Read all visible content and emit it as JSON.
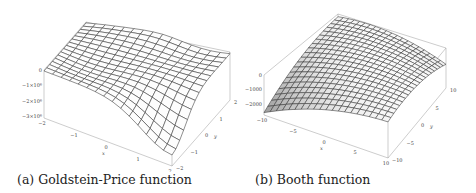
{
  "figures": [
    {
      "id": "a",
      "caption": "(a) Goldstein-Price function",
      "zaxis_ticks": [
        "0",
        "−1×10⁶",
        "−2×10⁶",
        "−3×10⁶"
      ],
      "xaxis_ticks": [
        "−2",
        "−1",
        "0",
        "1",
        "2"
      ],
      "yaxis_ticks": [
        "−2",
        "−1",
        "0",
        "1",
        "2"
      ],
      "xaxis_label": "x",
      "yaxis_label": "y"
    },
    {
      "id": "b",
      "caption": "(b) Booth function",
      "zaxis_ticks": [
        "0",
        "−1000",
        "−2000"
      ],
      "xaxis_ticks": [
        "−10",
        "−5",
        "0",
        "5",
        "10"
      ],
      "yaxis_ticks": [
        "−10",
        "−5",
        "0",
        "5",
        "10"
      ],
      "xaxis_label": "x",
      "yaxis_label": "y"
    }
  ],
  "chart_data": [
    {
      "type": "surface",
      "title": "(a) Goldstein-Price function",
      "xlabel": "x",
      "ylabel": "y",
      "zlabel": "",
      "xlim": [
        -2,
        2
      ],
      "ylim": [
        -2,
        2
      ],
      "zlim": [
        -3000000,
        0
      ],
      "xticks": [
        -2,
        -1,
        0,
        1,
        2
      ],
      "yticks": [
        -2,
        -1,
        0,
        1,
        2
      ],
      "zticks": [
        0,
        -1000000,
        -2000000,
        -3000000
      ],
      "grid": false,
      "mesh": "15x15 wireframe, negated Goldstein-Price surface"
    },
    {
      "type": "surface",
      "title": "(b) Booth function",
      "xlabel": "x",
      "ylabel": "y",
      "zlabel": "",
      "xlim": [
        -10,
        10
      ],
      "ylim": [
        -10,
        10
      ],
      "zlim": [
        -2500,
        0
      ],
      "xticks": [
        -10,
        -5,
        0,
        5,
        10
      ],
      "yticks": [
        -10,
        -5,
        0,
        5,
        10
      ],
      "zticks": [
        0,
        -1000,
        -2000
      ],
      "grid": false,
      "mesh": "20x20 wireframe, negated Booth surface"
    }
  ]
}
